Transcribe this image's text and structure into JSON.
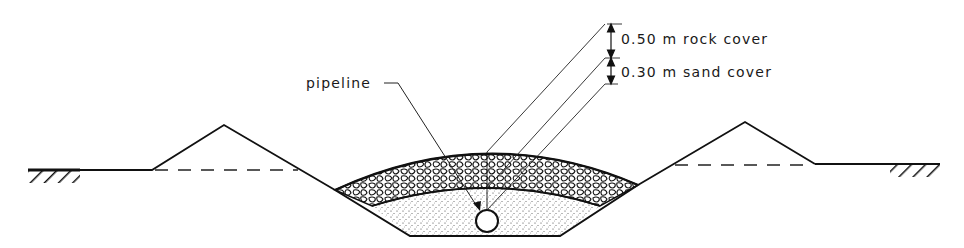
{
  "diagram": {
    "type": "cross-section",
    "labels": {
      "pipeline": "pipeline",
      "rock_cover": "0.50 m rock cover",
      "sand_cover": "0.30 m sand cover"
    },
    "layers": [
      {
        "name": "rock cover",
        "thickness_m": 0.5,
        "fill": "rock"
      },
      {
        "name": "sand cover",
        "thickness_m": 0.3,
        "fill": "sand"
      }
    ],
    "elements": [
      "left ground with hatching",
      "left spoil mound",
      "trench",
      "pipeline",
      "right spoil mound",
      "right ground with hatching"
    ],
    "colors": {
      "line": "#111111",
      "background": "#ffffff"
    }
  }
}
